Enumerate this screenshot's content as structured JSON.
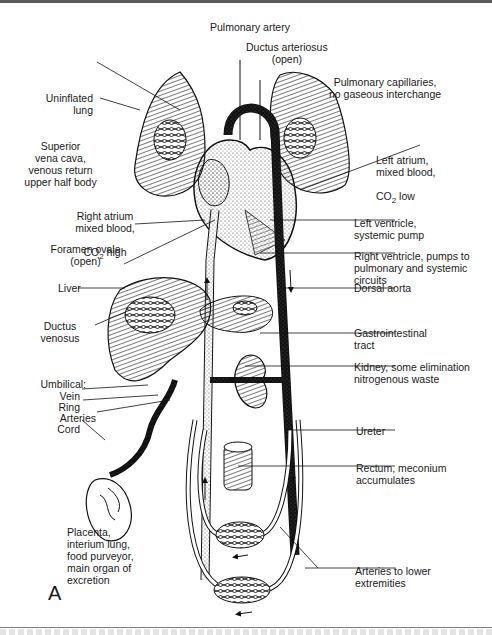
{
  "figure": {
    "panel_letter": "A",
    "labels": {
      "pulmonary_artery": "Pulmonary artery",
      "ductus_arteriosus": "Ductus arteriosus\n(open)",
      "pulmonary_capillaries": "Pulmonary capillaries,\nno gaseous interchange",
      "uninflated_lung": "Uninflated\nlung",
      "superior_vena_cava": "Superior\nvena cava,\nvenous return\nupper half body",
      "left_atrium": "Left atrium,\nmixed blood,",
      "left_atrium_co2": "CO",
      "left_atrium_co2_sub": "2",
      "left_atrium_co2_level": " low",
      "right_atrium": "Right atrium\nmixed blood,",
      "right_atrium_co2": "CO",
      "right_atrium_co2_sub": "2",
      "right_atrium_co2_level": " high",
      "left_ventricle": "Left ventricle,\nsystemic pump",
      "foramen_ovale": "Foramen ovale\n(open)",
      "right_ventricle": "Right ventricle, pumps to\npulmonary and systemic\ncircuits",
      "liver": "Liver",
      "dorsal_aorta": "Dorsal aorta",
      "ductus_venosus": "Ductus\nvenosus",
      "gastrointestinal_tract": "Gastrointestinal\ntract",
      "umbilical": "Umbilical:",
      "umbilical_vein": "Vein",
      "umbilical_ring": "Ring",
      "umbilical_arteries": "Arteries",
      "umbilical_cord": "Cord",
      "kidney": "Kidney, some elimination\nnitrogenous waste",
      "ureter": "Ureter",
      "rectum": "Rectum, meconium\naccumulates",
      "placenta": "Placenta,\ninterium lung,\nfood purveyor,\nmain organ of\nexcretion",
      "arteries_lower": "Arteries to lower\nextremities"
    }
  }
}
